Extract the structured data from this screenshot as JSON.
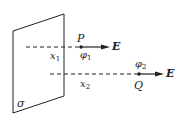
{
  "diagram": {
    "plane_label": "σ",
    "point_P": {
      "label": "P",
      "potential": "φ",
      "potential_sub": "1",
      "distance": "x",
      "distance_sub": "1"
    },
    "point_Q": {
      "label": "Q",
      "potential": "φ",
      "potential_sub": "2",
      "distance": "x",
      "distance_sub": "2"
    },
    "field_label": "E",
    "colors": {
      "stroke": "#222222",
      "background": "#ffffff"
    }
  }
}
